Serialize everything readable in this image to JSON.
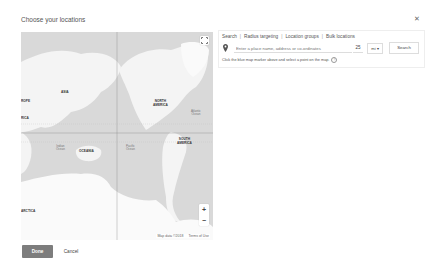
{
  "dialog": {
    "title": "Choose your locations",
    "close_icon": "close-icon"
  },
  "map": {
    "labels": {
      "asia": "ASIA",
      "europe": "ROPE",
      "africa": "RICA",
      "oceania": "OCEANIA",
      "north_america": "NORTH\nAMERICA",
      "south_america": "SOUTH\nAMERICA",
      "antarctica": "ARCTICA",
      "indian_ocean": "Indian\nOcean",
      "pacific_ocean": "Pacific\nOcean",
      "atlantic_ocean": "Atlantic\nOcean"
    },
    "attribution": {
      "map_data": "Map data ©2018",
      "terms": "Terms of Use"
    },
    "zoom_in": "+",
    "zoom_out": "−",
    "colors": {
      "land": "#f4f4f4",
      "water": "#d9d9d9"
    }
  },
  "panel": {
    "tabs": [
      {
        "label": "Search"
      },
      {
        "label": "Radius targeting"
      },
      {
        "label": "Location groups"
      },
      {
        "label": "Bulk locations"
      }
    ],
    "search_placeholder": "Enter a place name, address or co-ordinates",
    "radius_value": "25",
    "unit_value": "mi ▾",
    "search_button": "Search",
    "hint": "Click the blue map marker above and select a point on the map.",
    "hint_icon": "?"
  },
  "footer": {
    "done_label": "Done",
    "cancel_label": "Cancel",
    "done_color": "#7d7d7d"
  }
}
